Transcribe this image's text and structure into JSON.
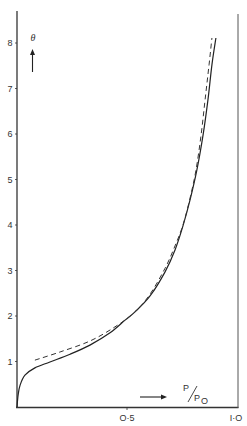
{
  "chart_data": {
    "type": "line",
    "title": "",
    "xlabel": "P/P0",
    "ylabel": "θ",
    "xlim": [
      0,
      1.0
    ],
    "ylim": [
      0,
      8.4
    ],
    "x_ticks": [
      "0·5",
      "1·0"
    ],
    "x_tick_values": [
      0.5,
      1.0
    ],
    "y_ticks": [
      "1",
      "2",
      "3",
      "4",
      "5",
      "6",
      "7",
      "8"
    ],
    "y_tick_values": [
      1,
      2,
      3,
      4,
      5,
      6,
      7,
      8
    ],
    "grid": false,
    "legend": null,
    "series": [
      {
        "name": "experimental",
        "style": "solid",
        "x": [
          0.0,
          0.005,
          0.014,
          0.036,
          0.081,
          0.149,
          0.24,
          0.33,
          0.421,
          0.489,
          0.534,
          0.602,
          0.67,
          0.715,
          0.751,
          0.783,
          0.814,
          0.842,
          0.864,
          0.882,
          0.9
        ],
        "y": [
          0.0,
          0.26,
          0.48,
          0.7,
          0.86,
          0.99,
          1.16,
          1.36,
          1.63,
          1.91,
          2.09,
          2.44,
          2.97,
          3.45,
          3.98,
          4.55,
          5.21,
          5.98,
          6.75,
          7.52,
          8.11
        ]
      },
      {
        "name": "theoretical",
        "style": "dashed",
        "x": [
          0.081,
          0.195,
          0.33,
          0.443,
          0.534,
          0.602,
          0.67,
          0.715,
          0.751,
          0.783,
          0.81,
          0.833,
          0.851,
          0.869,
          0.882
        ],
        "y": [
          1.03,
          1.21,
          1.45,
          1.76,
          2.09,
          2.48,
          3.05,
          3.54,
          4.0,
          4.59,
          5.21,
          5.98,
          6.75,
          7.52,
          8.11
        ]
      }
    ],
    "annotations": [
      "θ ↑",
      "→ P/P0"
    ]
  },
  "labels": {
    "y_axis_symbol": "θ",
    "x_axis_num": "P",
    "x_axis_den": "P",
    "x_axis_sub": "O",
    "x_tick_0_5": "O·5",
    "x_tick_1_0": "I·O",
    "y_ticks": [
      "1",
      "2",
      "3",
      "4",
      "5",
      "6",
      "7",
      "8"
    ]
  }
}
